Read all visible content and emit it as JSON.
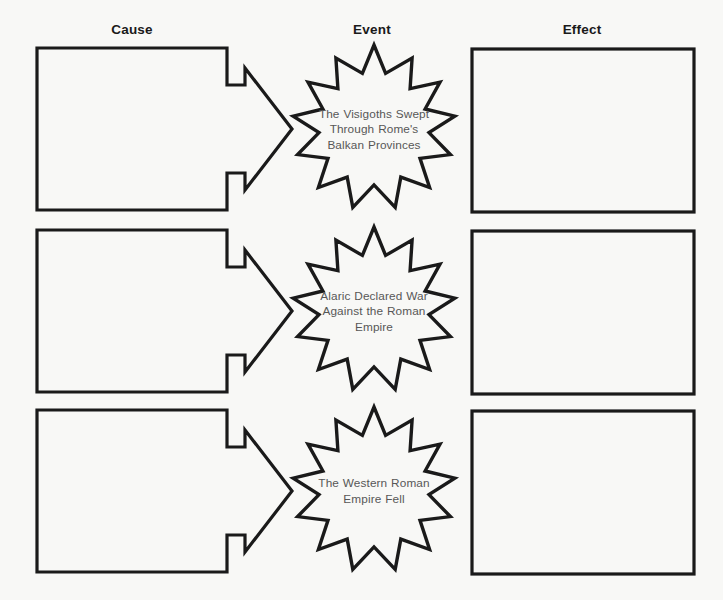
{
  "page": {
    "background_color": "#f8f8f6",
    "stroke_color": "#1a1a1a",
    "burst_text_color": "#575757",
    "width": 723,
    "height": 600
  },
  "columns": [
    {
      "key": "cause",
      "label": "Cause"
    },
    {
      "key": "event",
      "label": "Event"
    },
    {
      "key": "effect",
      "label": "Effect"
    }
  ],
  "rows": [
    {
      "cause_text": "",
      "event_text": "The Visigoths Swept Through Rome's Balkan Provinces",
      "effect_text": ""
    },
    {
      "cause_text": "",
      "event_text": "Alaric Declared War Against the Roman Empire",
      "effect_text": ""
    },
    {
      "cause_text": "",
      "event_text": "The Western Roman Empire Fell",
      "effect_text": ""
    }
  ],
  "shapes": {
    "cause_icon": "rectangle-with-arrow",
    "event_icon": "twelve-point-starburst",
    "effect_icon": "rectangle"
  }
}
